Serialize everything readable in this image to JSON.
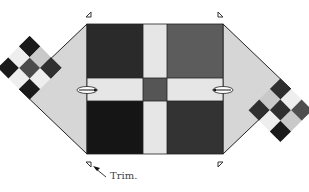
{
  "diagram": {
    "annotation": {
      "text": "Trim.",
      "x": 110,
      "y": 172
    },
    "block": {
      "x": 87,
      "y": 24,
      "w": 136,
      "h": 130
    },
    "colors": {
      "black": "#1a1a1a",
      "dark": "#2e2e2e",
      "darkgray": "#4a4a4a",
      "midgray": "#5a5a5a",
      "lightgray": "#c8c8c8",
      "light": "#dedede",
      "white": "#f2f2f2",
      "triangle": "#d6d6d6",
      "outline": "#222222"
    },
    "quadrants": {
      "top_left": "#2a2a2a",
      "top_right": "#5c5c5c",
      "bottom_left": "#151515",
      "bottom_right": "#333333"
    },
    "sashing": "#e6e6e6",
    "center_square": "#555555",
    "left_checker": [
      "#1a1a1a",
      "#c9c9c9",
      "#2f2f2f",
      "#eeeeee",
      "#4a4a4a",
      "#eeeeee",
      "#1a1a1a",
      "#eeeeee",
      "#1a1a1a"
    ],
    "right_checker": [
      "#4f4f4f",
      "#eeeeee",
      "#2f2f2f",
      "#c9c9c9",
      "#2f2f2f",
      "#c9c9c9",
      "#1a1a1a",
      "#eeeeee",
      "#2f2f2f"
    ],
    "trim_marks": [
      "top-left",
      "top-right",
      "bottom-left",
      "bottom-right"
    ]
  }
}
